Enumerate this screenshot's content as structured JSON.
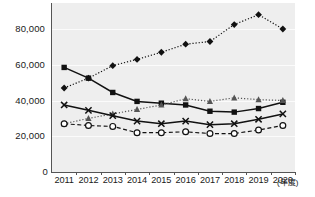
{
  "chart_data": {
    "type": "line",
    "title": "",
    "xlabel": "(年度)",
    "ylabel": "",
    "categories": [
      "2011",
      "2012",
      "2013",
      "2014",
      "2015",
      "2016",
      "2017",
      "2018",
      "2019",
      "2020"
    ],
    "ytick_labels": [
      "0",
      "20,000",
      "40,000",
      "60,000",
      "80,000"
    ],
    "ytick_values": [
      0,
      20000,
      40000,
      60000,
      80000
    ],
    "ylim": [
      0,
      94000
    ],
    "grid": true,
    "legend": "none",
    "series": [
      {
        "name": "diamond-series",
        "marker": "diamond",
        "line_style": "dotted",
        "color": "#111111",
        "values": [
          47000,
          52500,
          59500,
          63000,
          67000,
          71500,
          73000,
          82500,
          88000,
          80000
        ]
      },
      {
        "name": "square-series",
        "marker": "square",
        "line_style": "solid",
        "color": "#111111",
        "values": [
          58500,
          52500,
          44500,
          39500,
          38500,
          37500,
          34000,
          33500,
          35500,
          39000
        ]
      },
      {
        "name": "triangle-series",
        "marker": "triangle",
        "line_style": "dotted",
        "color": "#555555",
        "values": [
          27000,
          30000,
          32500,
          35000,
          37500,
          41000,
          39500,
          41500,
          40500,
          40000
        ]
      },
      {
        "name": "x-series",
        "marker": "x",
        "line_style": "solid",
        "color": "#111111",
        "values": [
          37500,
          34500,
          31500,
          28500,
          27000,
          28500,
          26500,
          27000,
          29500,
          32500
        ]
      },
      {
        "name": "circle-series",
        "marker": "circle",
        "line_style": "dashed",
        "color": "#111111",
        "values": [
          27000,
          26000,
          25500,
          22000,
          22000,
          22500,
          21500,
          21500,
          23500,
          26000
        ]
      }
    ]
  }
}
